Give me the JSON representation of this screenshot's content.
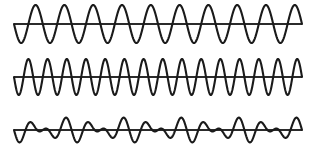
{
  "figure": {
    "background_color": "#ffffff",
    "stroke_color": "#1a1a1a",
    "axis_color": "#2b2b2b",
    "stroke_width": 2.1,
    "axis_width": 1.9,
    "width": 314,
    "height": 156,
    "x_start": 14,
    "x_end": 302
  },
  "chart_data": {
    "type": "line",
    "subtitle": "",
    "xlabel": "",
    "ylabel": "",
    "grid": false,
    "legend_position": "none",
    "axis_ranges": {
      "x": [
        0,
        1
      ],
      "y": [
        -1,
        1
      ]
    },
    "panels": [
      {
        "name": "wave-1",
        "label": "Wave 1 (lower frequency)",
        "baseline_y": 24,
        "amplitude_px": 19,
        "cycles": 10,
        "phase_deg": 180,
        "x_start": 14,
        "x_end": 302,
        "waveform": "sine",
        "components": [
          {
            "amplitude": 1.0,
            "cycles": 10,
            "phase_deg": 180
          }
        ]
      },
      {
        "name": "wave-2",
        "label": "Wave 2 (higher frequency)",
        "baseline_y": 77,
        "amplitude_px": 18,
        "cycles": 15,
        "phase_deg": 180,
        "x_start": 14,
        "x_end": 302,
        "waveform": "sine",
        "components": [
          {
            "amplitude": 1.0,
            "cycles": 15,
            "phase_deg": 180
          }
        ]
      },
      {
        "name": "wave-sum",
        "label": "Resultant (sum of wave 1 and wave 2)",
        "baseline_y": 130,
        "amplitude_px": 13,
        "cycles": 12.5,
        "beat_cycles": 5,
        "phase_deg": 180,
        "x_start": 14,
        "x_end": 302,
        "waveform": "beat-sum",
        "components": [
          {
            "amplitude": 0.5,
            "cycles": 10,
            "phase_deg": 180
          },
          {
            "amplitude": 0.5,
            "cycles": 15,
            "phase_deg": 180
          }
        ]
      }
    ],
    "axis_lines": [
      {
        "name": "axis-1",
        "y": 24,
        "x_start": 14,
        "x_end": 302
      },
      {
        "name": "axis-2",
        "y": 77,
        "x_start": 14,
        "x_end": 302
      },
      {
        "name": "axis-3",
        "y": 130,
        "x_start": 14,
        "x_end": 302
      }
    ]
  }
}
